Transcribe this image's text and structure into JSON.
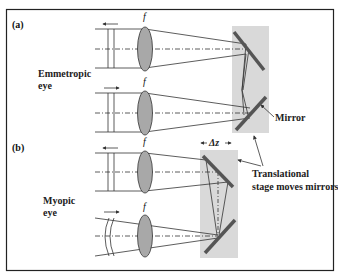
{
  "figure": {
    "panels": [
      {
        "id": "a",
        "label": "(a)",
        "case_label_line1": "Emmetropic",
        "case_label_line2": "eye"
      },
      {
        "id": "b",
        "label": "(b)",
        "case_label_line1": "Myopic",
        "case_label_line2": "eye"
      }
    ],
    "lens_label": "f",
    "mirror_label": "Mirror",
    "delta_label": "Δz",
    "stage_note_line1": "Translational",
    "stage_note_line2": "stage moves mirrors",
    "colors": {
      "stage": "#d9d9d9",
      "mirror": "#555555",
      "lens_fill": "#a8a8a8",
      "line": "#333333",
      "border": "#222222"
    }
  }
}
